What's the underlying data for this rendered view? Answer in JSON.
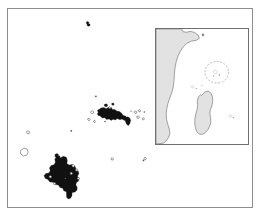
{
  "figure": {
    "type": "map",
    "width": 260,
    "height": 216,
    "background_color": "#ffffff"
  },
  "colors": {
    "frame_stroke": "#8d8d8d",
    "inset_frame_stroke": "#6f6f6f",
    "land_filled": "#111111",
    "land_outline_stroke": "#4a4a4a",
    "land_outline_fill": "#ffffff",
    "inset_land_fill": "#e2e2e2",
    "inset_land_stroke": "#7a7a7a",
    "dashed_highlight": "#9a9a9a",
    "ocean": "#ffffff"
  },
  "main_map": {
    "name": "main-map-panel",
    "frame": {
      "x": 7,
      "y": 8,
      "width": 246,
      "height": 200
    },
    "ocean_label": "",
    "island_groups": [
      {
        "name": "northern-outlier-island",
        "style": "filled",
        "approx_position": {
          "x": 86,
          "y": 22
        },
        "size": "very-small"
      },
      {
        "name": "central-archipelago-main",
        "style": "filled",
        "approx_position": {
          "x": 105,
          "y": 110
        },
        "size": "medium"
      },
      {
        "name": "central-archipelago-satellite-east",
        "style": "filled",
        "approx_position": {
          "x": 124,
          "y": 120
        },
        "size": "small"
      },
      {
        "name": "southwest-archipelago-main",
        "style": "filled",
        "approx_position": {
          "x": 57,
          "y": 175
        },
        "size": "large"
      },
      {
        "name": "western-atoll-outline",
        "style": "outline",
        "approx_position": {
          "x": 18,
          "y": 145
        },
        "size": "small"
      },
      {
        "name": "western-islet-outline",
        "style": "outline",
        "approx_position": {
          "x": 21,
          "y": 127
        },
        "size": "very-small"
      },
      {
        "name": "southcentral-islet",
        "style": "outline",
        "approx_position": {
          "x": 113,
          "y": 159
        },
        "size": "very-small"
      },
      {
        "name": "southeast-islet",
        "style": "outline",
        "approx_position": {
          "x": 145,
          "y": 162
        },
        "size": "very-small"
      },
      {
        "name": "eastern-islet-cluster",
        "style": "outline",
        "approx_position": {
          "x": 133,
          "y": 112
        },
        "size": "very-small"
      }
    ]
  },
  "inset_map": {
    "name": "locator-inset-panel",
    "frame": {
      "x": 154,
      "y": 27,
      "width": 94,
      "height": 117
    },
    "landmasses": [
      {
        "name": "east-africa-mainland",
        "style": "filled-gray",
        "description": "East African coastline including Horn of Africa"
      },
      {
        "name": "madagascar",
        "style": "filled-gray",
        "description": "Island of Madagascar"
      }
    ],
    "annotations": [
      {
        "name": "study-area-dashed-ellipse",
        "style": "dashed-ellipse",
        "description": "Dashed ellipse highlighting the study archipelago region"
      },
      {
        "name": "northern-point-marker",
        "style": "dot",
        "description": "Small marker near the Horn of Africa"
      },
      {
        "name": "eastern-point-marker",
        "style": "dot",
        "description": "Small marker east of Madagascar"
      },
      {
        "name": "comoros-faint-marker",
        "style": "faint-outline",
        "description": "Faint outline between Africa and Madagascar"
      }
    ]
  },
  "labels": {
    "visible_text": []
  }
}
